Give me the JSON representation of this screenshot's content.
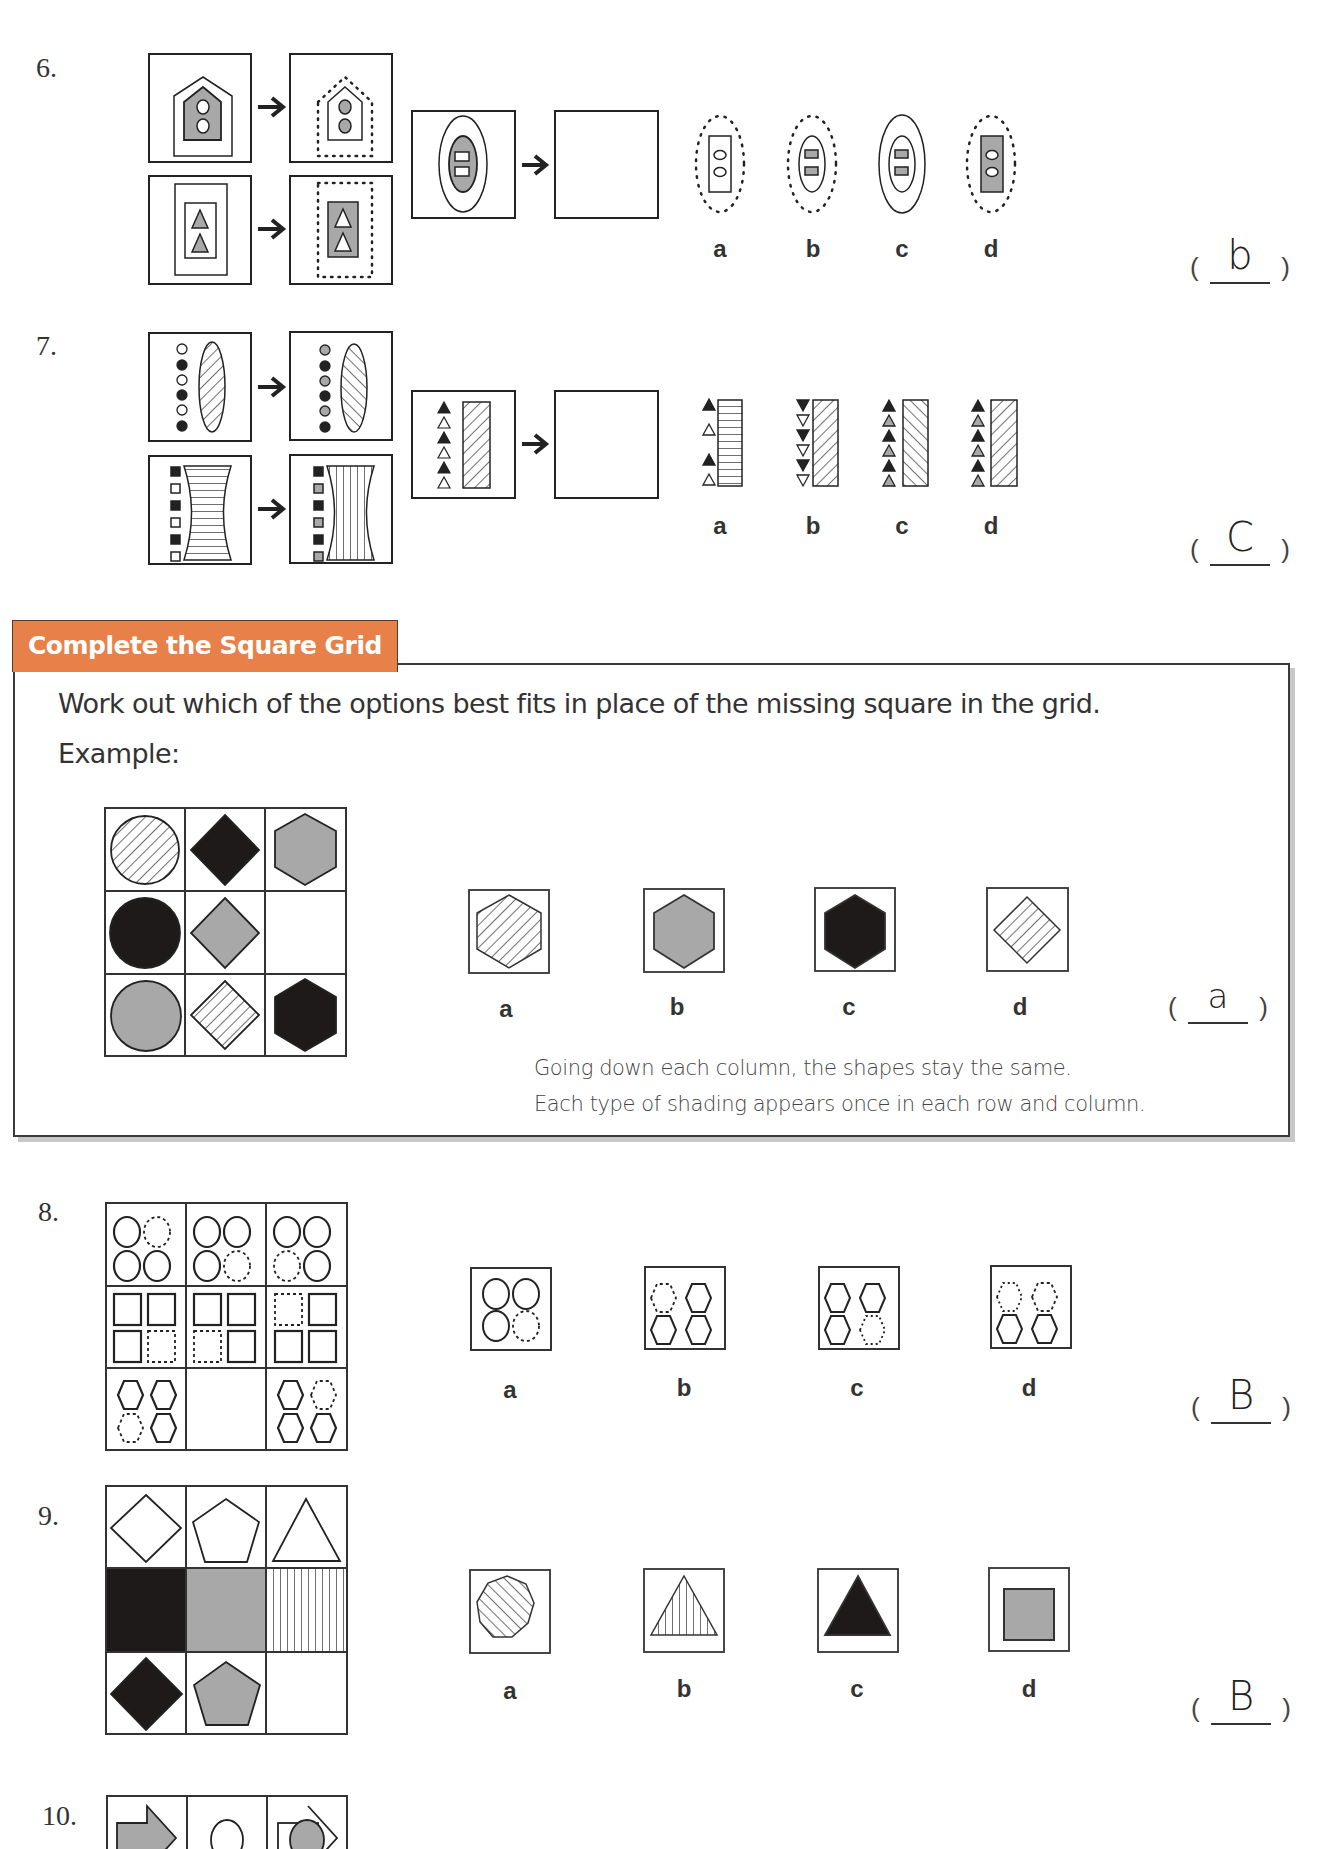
{
  "section": {
    "header_title": "Complete the Square Grid",
    "instruction": "Work out which of the options best fits in place of the missing square in the grid.",
    "example_label": "Example:",
    "example": {
      "grid": [
        [
          "circle-hatched",
          "diamond-black",
          "hexagon-grey"
        ],
        [
          "circle-black",
          "diamond-grey",
          "empty"
        ],
        [
          "circle-grey",
          "diamond-hatched",
          "hexagon-black"
        ]
      ],
      "options": [
        {
          "label": "a",
          "shape": "hexagon-hatched"
        },
        {
          "label": "b",
          "shape": "hexagon-grey"
        },
        {
          "label": "c",
          "shape": "hexagon-black"
        },
        {
          "label": "d",
          "shape": "diamond-hatched"
        }
      ],
      "answer": "a",
      "explanation_line1": "Going down each column, the shapes stay the same.",
      "explanation_line2": "Each type of shading appears once in each row and column."
    }
  },
  "questions": [
    {
      "number": "6.",
      "type": "analogy",
      "options": [
        {
          "label": "a"
        },
        {
          "label": "b"
        },
        {
          "label": "c"
        },
        {
          "label": "d"
        }
      ],
      "answer": "b"
    },
    {
      "number": "7.",
      "type": "analogy",
      "options": [
        {
          "label": "a"
        },
        {
          "label": "b"
        },
        {
          "label": "c"
        },
        {
          "label": "d"
        }
      ],
      "answer": "C"
    },
    {
      "number": "8.",
      "type": "square-grid",
      "options": [
        {
          "label": "a"
        },
        {
          "label": "b"
        },
        {
          "label": "c"
        },
        {
          "label": "d"
        }
      ],
      "answer": "B"
    },
    {
      "number": "9.",
      "type": "square-grid",
      "options": [
        {
          "label": "a",
          "shape": "heptagon-hatched"
        },
        {
          "label": "b",
          "shape": "triangle-vertical-stripes"
        },
        {
          "label": "c",
          "shape": "triangle-black"
        },
        {
          "label": "d",
          "shape": "square-grey"
        }
      ],
      "answer": "B"
    },
    {
      "number": "10.",
      "type": "square-grid"
    }
  ],
  "colors": {
    "header_orange": "#e8804a",
    "grey_fill": "#a8a8a8",
    "black_fill": "#1e1a1a",
    "line": "#2a2a2a"
  }
}
